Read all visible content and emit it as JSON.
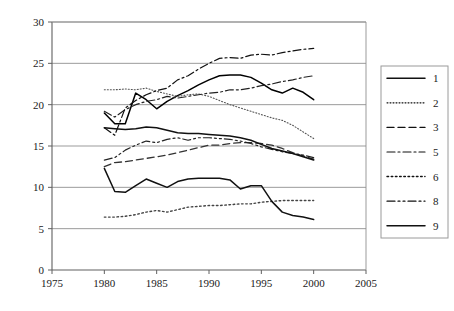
{
  "chart_data": {
    "type": "line",
    "title": "",
    "xlabel": "",
    "ylabel": "",
    "xlim": [
      1975,
      2005
    ],
    "ylim": [
      0,
      30
    ],
    "xticks": [
      1975,
      1980,
      1985,
      1990,
      1995,
      2000,
      2005
    ],
    "yticks": [
      0,
      5,
      10,
      15,
      20,
      25,
      30
    ],
    "grid": "horizontal",
    "legend_position": "right",
    "x": [
      1980,
      1981,
      1982,
      1983,
      1984,
      1985,
      1986,
      1987,
      1988,
      1989,
      1990,
      1991,
      1992,
      1993,
      1994,
      1995,
      1996,
      1997,
      1998,
      1999,
      2000
    ],
    "series": [
      {
        "name": "1",
        "style": "solid",
        "color": "#000000",
        "values": [
          19.0,
          17.7,
          17.7,
          21.4,
          20.6,
          19.5,
          20.4,
          21.1,
          21.7,
          22.4,
          23.0,
          23.5,
          23.6,
          23.6,
          23.3,
          22.6,
          21.8,
          21.4,
          22.0,
          21.5,
          20.6
        ]
      },
      {
        "name": "2",
        "style": "dotted-fine",
        "color": "#555555",
        "values": [
          21.8,
          21.8,
          21.9,
          21.8,
          22.0,
          21.6,
          21.3,
          21.0,
          21.2,
          21.3,
          21.0,
          20.5,
          20.0,
          19.6,
          19.2,
          18.8,
          18.4,
          18.1,
          17.5,
          16.7,
          15.9
        ]
      },
      {
        "name": "3",
        "style": "dashed",
        "color": "#333333",
        "values": [
          12.5,
          13.0,
          13.1,
          13.3,
          13.5,
          13.7,
          13.9,
          14.2,
          14.5,
          14.8,
          15.1,
          15.1,
          15.3,
          15.4,
          15.4,
          15.3,
          15.1,
          14.7,
          14.2,
          13.8,
          13.4
        ]
      },
      {
        "name": "5",
        "style": "dashdot",
        "color": "#222222",
        "values": [
          19.2,
          18.5,
          19.4,
          20.0,
          20.4,
          20.6,
          21.0,
          20.8,
          21.0,
          21.2,
          21.4,
          21.5,
          21.8,
          21.8,
          22.0,
          22.3,
          22.5,
          22.8,
          23.0,
          23.3,
          23.5
        ]
      },
      {
        "name": "6",
        "style": "dotted-coarse",
        "color": "#444444",
        "values": [
          6.4,
          6.4,
          6.5,
          6.7,
          7.0,
          7.2,
          7.0,
          7.3,
          7.6,
          7.7,
          7.8,
          7.8,
          7.9,
          8.0,
          8.0,
          8.2,
          8.3,
          8.4,
          8.4,
          8.4,
          8.4
        ]
      },
      {
        "name": "8",
        "style": "dashdotdot",
        "color": "#222222",
        "values": [
          13.3,
          13.6,
          14.5,
          15.1,
          15.6,
          15.4,
          15.8,
          16.0,
          15.7,
          16.0,
          16.0,
          15.9,
          15.8,
          15.6,
          15.3,
          14.9,
          14.6,
          14.3,
          14.1,
          13.9,
          13.6
        ]
      },
      {
        "name": "9",
        "style": "solid",
        "color": "#111111",
        "values": [
          12.3,
          9.5,
          9.4,
          10.2,
          11.0,
          10.5,
          10.0,
          10.7,
          11.0,
          11.1,
          11.1,
          11.1,
          10.9,
          9.8,
          10.2,
          10.2,
          8.3,
          7.0,
          6.6,
          6.4,
          6.1
        ]
      }
    ],
    "upper_lines": [
      {
        "name": "5-upper",
        "style": "dashdot",
        "values": [
          17.2,
          16.3,
          19.6,
          20.5,
          21.2,
          21.7,
          22.0,
          23.0,
          23.5,
          24.3,
          25.0,
          25.6,
          25.7,
          25.6,
          26.0,
          26.1,
          26.0,
          26.3,
          26.5,
          26.7,
          26.8
        ]
      },
      {
        "name": "9-upper",
        "style": "solid",
        "values": [
          17.2,
          17.1,
          17.0,
          17.1,
          17.3,
          17.2,
          16.9,
          16.6,
          16.5,
          16.5,
          16.4,
          16.3,
          16.2,
          16.0,
          15.7,
          15.2,
          14.7,
          14.4,
          14.1,
          13.7,
          13.3
        ]
      }
    ]
  },
  "legend": {
    "items": [
      {
        "label": "1",
        "style": "solid"
      },
      {
        "label": "2",
        "style": "dotted-fine"
      },
      {
        "label": "3",
        "style": "dashed"
      },
      {
        "label": "5",
        "style": "dashdot"
      },
      {
        "label": "6",
        "style": "dotted-coarse"
      },
      {
        "label": "8",
        "style": "dashdotdot"
      },
      {
        "label": "9",
        "style": "solid"
      }
    ]
  },
  "axes": {
    "x_tick_labels": [
      "1975",
      "1980",
      "1985",
      "1990",
      "1995",
      "2000",
      "2005"
    ],
    "y_tick_labels": [
      "0",
      "5",
      "10",
      "15",
      "20",
      "25",
      "30"
    ]
  }
}
